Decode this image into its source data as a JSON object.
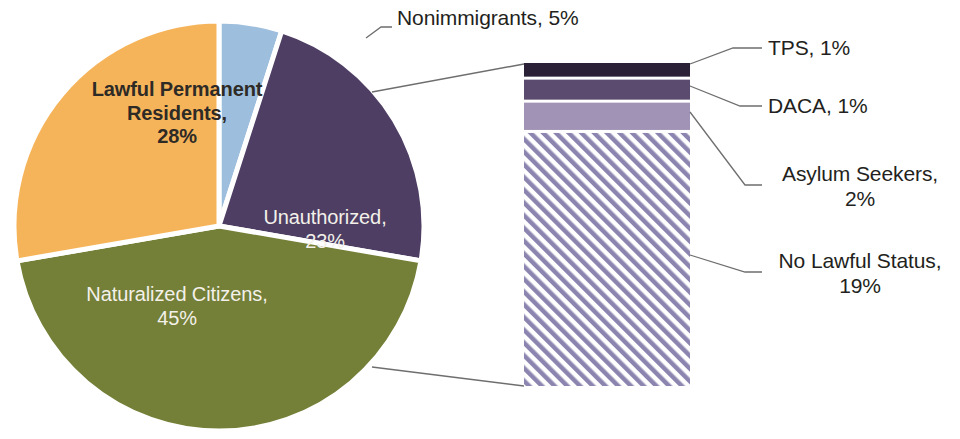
{
  "chart_data": {
    "type": "pie",
    "title": "",
    "subtitle": "",
    "xlabel": "",
    "ylabel": "",
    "legend_position": "none",
    "grid": false,
    "units": "percent",
    "categories": [
      "Lawful Permanent Residents",
      "Nonimmigrants",
      "Unauthorized",
      "Naturalized Citizens"
    ],
    "values": [
      28,
      5,
      23,
      45
    ],
    "slices": [
      {
        "label": "Lawful Permanent Residents",
        "value": 28,
        "value_text": "28%",
        "color": "#f6b45a",
        "label_text": "Lawful Permanent\nResidents,\n28%",
        "label_color": "#2e2a26",
        "label_inside": true
      },
      {
        "label": "Nonimmigrants",
        "value": 5,
        "value_text": "5%",
        "color": "#9dbfdd",
        "label_text": "Nonimmigrants, 5%",
        "label_color": "#231f20",
        "label_inside": false
      },
      {
        "label": "Unauthorized",
        "value": 23,
        "value_text": "23%",
        "color": "#4e3e63",
        "label_text": "Unauthorized,\n23%",
        "label_color": "#f3f1ea",
        "label_inside": true
      },
      {
        "label": "Naturalized Citizens",
        "value": 45,
        "value_text": "45%",
        "color": "#747f37",
        "label_text": "Naturalized Citizens,\n45%",
        "label_color": "#f3f1ea",
        "label_inside": true
      }
    ],
    "breakout": {
      "type": "bar",
      "orientation": "stacked-vertical",
      "source_slice": "Unauthorized",
      "source_total": 23,
      "categories": [
        "TPS",
        "DACA",
        "Asylum Seekers",
        "No Lawful Status"
      ],
      "values": [
        1,
        1,
        2,
        19
      ],
      "segments": [
        {
          "label": "TPS",
          "value": 1,
          "value_text": "1%",
          "label_text": "TPS, 1%",
          "color": "#2b2136",
          "pattern": "solid"
        },
        {
          "label": "DACA",
          "value": 1,
          "value_text": "1%",
          "label_text": "DACA, 1%",
          "color": "#5b4b6e",
          "pattern": "solid"
        },
        {
          "label": "Asylum Seekers",
          "value": 2,
          "value_text": "2%",
          "label_text": "Asylum Seekers,\n2%",
          "color": "#a193b5",
          "pattern": "solid"
        },
        {
          "label": "No Lawful Status",
          "value": 19,
          "value_text": "19%",
          "label_text": "No Lawful Status,\n19%",
          "color": "#8b85b0",
          "pattern": "diagonal-hatch"
        }
      ]
    }
  },
  "pie": {
    "lawful_permanent_residents": "Lawful Permanent\nResidents,\n28%",
    "unauthorized": "Unauthorized,\n23%",
    "naturalized_citizens": "Naturalized Citizens,\n45%",
    "nonimmigrants": "Nonimmigrants, 5%"
  },
  "bar_labels": {
    "tps": "TPS, 1%",
    "daca": "DACA, 1%",
    "asylum_seekers": "Asylum Seekers,\n2%",
    "no_lawful_status": "No Lawful Status,\n19%"
  },
  "colors": {
    "orange": "#f6b45a",
    "green": "#747f37",
    "purple": "#4e3e63",
    "light_blue": "#9dbfdd",
    "bar_tps": "#2b2136",
    "bar_daca": "#5b4b6e",
    "bar_asylum": "#a193b5",
    "bar_no_status": "#8b85b0",
    "leader_line": "#6e6e6e",
    "text_dark": "#231f20",
    "text_light": "#f3f1ea"
  }
}
